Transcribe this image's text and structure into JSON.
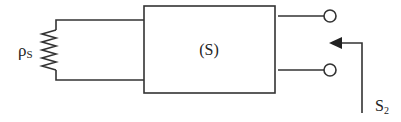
{
  "diagram": {
    "source_resistor": {
      "symbol": "ρ",
      "subscript": "S"
    },
    "system_block": {
      "label": "(S)"
    },
    "switch": {
      "symbol": "S",
      "subscript": "2"
    },
    "terminals": [
      "upper-terminal",
      "lower-terminal"
    ],
    "colors": {
      "stroke": "#333333",
      "background": "#ffffff"
    }
  }
}
